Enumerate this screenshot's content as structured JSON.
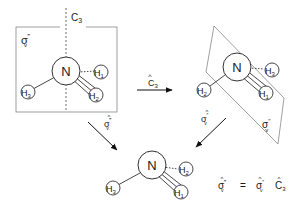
{
  "diagram": {
    "colors": {
      "line": "#333333",
      "plane": "#777777",
      "background": "#ffffff"
    },
    "left_molecule": {
      "axis_label": "C",
      "axis_sub": "3",
      "plane_label": "σ",
      "plane_sub": "v",
      "plane_sup": "‴",
      "center": "N",
      "atoms": [
        {
          "label": "H",
          "sub": "1",
          "position": "right-back"
        },
        {
          "label": "H",
          "sub": "2",
          "position": "right-front"
        },
        {
          "label": "H",
          "sub": "3",
          "position": "left"
        }
      ]
    },
    "right_molecule": {
      "plane_label": "σ",
      "plane_sub": "v",
      "plane_sup": "″",
      "center": "N",
      "atoms": [
        {
          "label": "H",
          "sub": "3",
          "position": "right-back"
        },
        {
          "label": "H",
          "sub": "1",
          "position": "right-front"
        },
        {
          "label": "H",
          "sub": "2",
          "position": "left"
        }
      ]
    },
    "bottom_molecule": {
      "center": "N",
      "atoms": [
        {
          "label": "H",
          "sub": "2",
          "position": "right-back"
        },
        {
          "label": "H",
          "sub": "1",
          "position": "right-front"
        },
        {
          "label": "H",
          "sub": "3",
          "position": "left"
        }
      ]
    },
    "arrows": [
      {
        "id": "c3",
        "op": "C",
        "sub": "3",
        "hat": "^",
        "from": "left",
        "to": "right"
      },
      {
        "id": "sigma-v-triple",
        "op": "σ",
        "sub": "v",
        "sup": "‴",
        "hat": "^",
        "from": "left",
        "to": "bottom"
      },
      {
        "id": "sigma-v-double",
        "op": "σ",
        "sub": "v",
        "sup": "″",
        "hat": "^",
        "from": "right",
        "to": "bottom"
      }
    ],
    "equation": {
      "lhs": {
        "op": "σ",
        "sub": "v",
        "sup": "‴",
        "hat": "^"
      },
      "equals": "=",
      "rhs": [
        {
          "op": "σ",
          "sub": "v",
          "sup": "″",
          "hat": "^"
        },
        {
          "op": "C",
          "sub": "3",
          "hat": "^"
        }
      ]
    }
  }
}
